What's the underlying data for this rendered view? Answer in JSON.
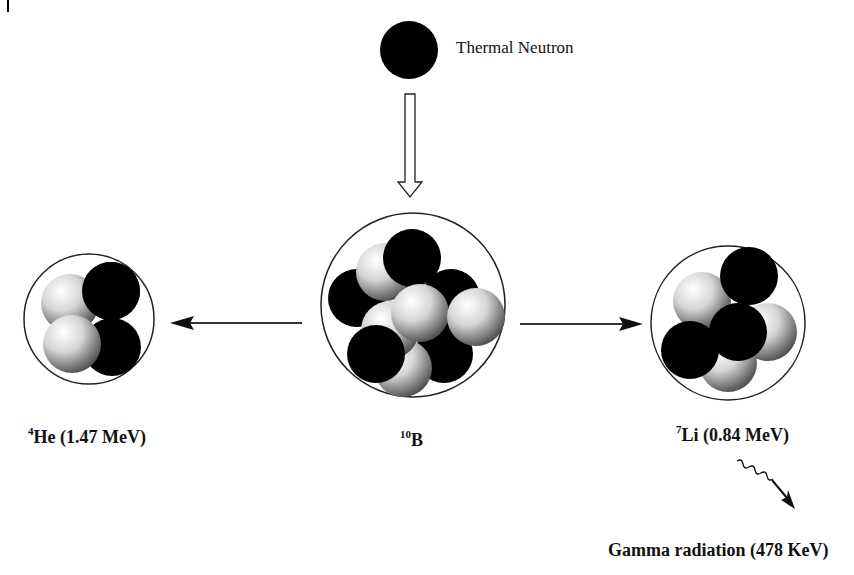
{
  "neutron": {
    "label": "Thermal Neutron"
  },
  "nuclei": {
    "helium": {
      "isotope_mass": "4",
      "symbol": "He",
      "energy": " (1.47 MeV)"
    },
    "boron": {
      "isotope_mass": "10",
      "symbol": "B"
    },
    "lithium": {
      "isotope_mass": "7",
      "symbol": "Li",
      "energy": " (0.84 MeV)"
    }
  },
  "gamma": {
    "label": "Gamma radiation (478 KeV)"
  },
  "colors": {
    "neutron": "#000000",
    "proton_light": "#f2f2f2",
    "proton_dark": "#6a6a6a",
    "outline": "#222222"
  }
}
